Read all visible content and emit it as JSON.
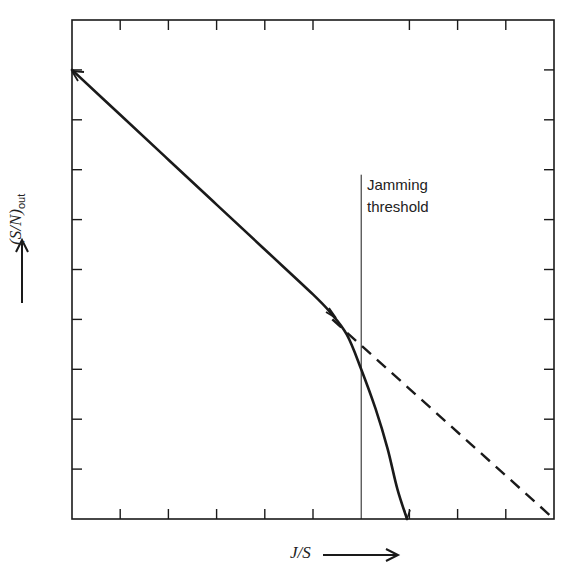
{
  "chart_data": {
    "type": "line",
    "title": "",
    "xlabel": "J/S",
    "ylabel": "(S/N)out",
    "xlim": [
      0,
      10
    ],
    "ylim": [
      0,
      10
    ],
    "grid": false,
    "tick_labels": "none",
    "x_ticks": [
      0,
      1,
      2,
      3,
      4,
      5,
      6,
      7,
      8,
      9,
      10
    ],
    "y_ticks": [
      0,
      1,
      2,
      3,
      4,
      5,
      6,
      7,
      8,
      9,
      10
    ],
    "series": [
      {
        "name": "Linear extrapolation (dashed)",
        "style": "dashed",
        "x": [
          5.4,
          10
        ],
        "y": [
          4.0,
          0
        ]
      },
      {
        "name": "Actual (S/N)out",
        "style": "solid",
        "x": [
          0,
          1,
          2,
          3,
          4,
          5,
          5.35,
          5.7,
          6.0,
          6.3,
          6.55,
          6.75,
          6.95
        ],
        "y": [
          9.0,
          8.1,
          7.2,
          6.3,
          5.4,
          4.5,
          4.15,
          3.7,
          3.0,
          2.2,
          1.4,
          0.6,
          0
        ]
      }
    ],
    "annotations": [
      {
        "type": "vline",
        "x": 6.0,
        "y_from": 0,
        "y_to": 6.9,
        "text": "Jamming threshold"
      }
    ]
  },
  "labels": {
    "x_axis": "J/S",
    "y_axis_main": "(S/N)",
    "y_axis_sub": "out",
    "threshold_line1": "Jamming",
    "threshold_line2": "threshold"
  },
  "colors": {
    "ink": "#1a1a1a",
    "background": "#ffffff"
  }
}
